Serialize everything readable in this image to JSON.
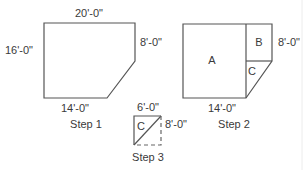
{
  "diagram": {
    "step1": {
      "caption": "Step 1",
      "dimensions": {
        "top": "20'-0\"",
        "left": "16'-0\"",
        "right": "8'-0\"",
        "bottom": "14'-0\""
      }
    },
    "step2": {
      "caption": "Step 2",
      "regions": [
        "A",
        "B",
        "C"
      ],
      "dimensions": {
        "right": "8'-0\"",
        "bottom": "14'-0\""
      }
    },
    "step3": {
      "caption": "Step 3",
      "region": "C",
      "dimensions": {
        "top": "6'-0\"",
        "right": "8'-0\""
      }
    },
    "colors": {
      "line": "#555555",
      "text": "#3a3a3a",
      "background": "#ffffff"
    }
  }
}
